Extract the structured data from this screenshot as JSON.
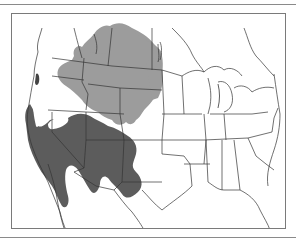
{
  "map": {
    "type": "species-range-map",
    "region": "Western and central North America (USA, southern Canada, northern Mexico)",
    "colors": {
      "background": "#ffffff",
      "boundary_lines": "#333333",
      "range_light": "#9c9c9c",
      "range_dark": "#5c5c5c",
      "frame": "#7a7a7a"
    },
    "legend": [],
    "labels": []
  }
}
